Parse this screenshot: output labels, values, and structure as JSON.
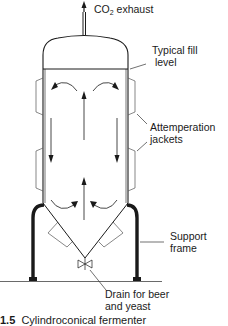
{
  "diagram": {
    "title": "Cylindroconical fermenter",
    "colors": {
      "line": "#1a1a1a",
      "background": "#ffffff"
    },
    "labels": {
      "co2_exhaust": {
        "main": "CO",
        "sub": "2",
        "rest": " exhaust"
      },
      "fill_level": [
        "Typical fill",
        " level"
      ],
      "jackets": [
        "Attemperation",
        "jackets"
      ],
      "support": [
        "Support",
        "frame"
      ],
      "drain": [
        "Drain for beer",
        "and yeast"
      ]
    },
    "caption": {
      "number": "1.5",
      "text": "Cylindroconical fermenter"
    },
    "components": [
      "co2-exhaust-pipe",
      "vessel-dome",
      "fill-level-line",
      "cylindrical-body",
      "attemperation-jackets",
      "convection-arrows",
      "conical-bottom",
      "drain-valve",
      "support-frame",
      "ground-line"
    ]
  }
}
